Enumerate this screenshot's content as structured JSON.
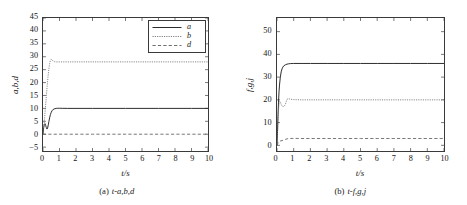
{
  "figure": {
    "panels": [
      {
        "id": "panel-a",
        "caption_number": "(a)",
        "caption_text": "t-a,b,d",
        "chart_data": {
          "type": "line",
          "title": "",
          "xlabel": "t/s",
          "ylabel": "a,b,d",
          "xlim": [
            0,
            10
          ],
          "ylim": [
            -6.5,
            45
          ],
          "xticks": [
            "0",
            "1",
            "2",
            "3",
            "4",
            "5",
            "6",
            "7",
            "8",
            "9",
            "10"
          ],
          "xtick_values": [
            0,
            1,
            2,
            3,
            4,
            5,
            6,
            7,
            8,
            9,
            10
          ],
          "yticks": [
            "-5",
            "0",
            "5",
            "10",
            "15",
            "20",
            "25",
            "30",
            "35",
            "40",
            "45"
          ],
          "ytick_values": [
            -5,
            0,
            5,
            10,
            15,
            20,
            25,
            30,
            35,
            40,
            45
          ],
          "grid": false,
          "legend_position": "upper right",
          "series": [
            {
              "name": "a",
              "style": "solid",
              "color": "#2b2b2b",
              "steady_value": 10,
              "x": [
                0,
                0.04,
                0.08,
                0.12,
                0.16,
                0.2,
                0.24,
                0.28,
                0.32,
                0.36,
                0.4,
                0.45,
                0.5,
                0.55,
                0.6,
                0.7,
                0.8,
                0.9,
                1.0,
                1.2,
                1.5,
                2.0,
                3.0,
                4.0,
                5.0,
                6.0,
                7.0,
                8.0,
                9.0,
                10.0
              ],
              "values": [
                0,
                2.6,
                3.8,
                4.1,
                3.5,
                2.6,
                2.0,
                2.4,
                3.6,
                5.0,
                6.3,
                7.6,
                8.5,
                9.1,
                9.5,
                9.85,
                10.0,
                10.05,
                10.05,
                10.02,
                10.0,
                10.0,
                10.0,
                10.0,
                10.0,
                10.0,
                10.0,
                10.0,
                10.0,
                10.0
              ]
            },
            {
              "name": "b",
              "style": "dotted",
              "color": "#6d6d6d",
              "steady_value": 28,
              "x": [
                0,
                0.05,
                0.1,
                0.15,
                0.2,
                0.25,
                0.3,
                0.35,
                0.4,
                0.45,
                0.5,
                0.55,
                0.6,
                0.7,
                0.8,
                1.0,
                1.5,
                2.0,
                3.0,
                4.0,
                5.0,
                6.0,
                7.0,
                8.0,
                9.0,
                10.0
              ],
              "values": [
                0,
                3.0,
                6.5,
                10.5,
                14.5,
                18.5,
                22.0,
                25.0,
                27.2,
                28.6,
                29.0,
                28.8,
                28.4,
                28.1,
                28.0,
                28.0,
                28.0,
                28.0,
                28.0,
                28.0,
                28.0,
                28.0,
                28.0,
                28.0,
                28.0,
                28.0
              ]
            },
            {
              "name": "d",
              "style": "dashed",
              "color": "#5c5c5c",
              "steady_value": 0,
              "x": [
                0,
                0.5,
                1,
                2,
                3,
                4,
                5,
                6,
                7,
                8,
                9,
                10
              ],
              "values": [
                0,
                0,
                0,
                0,
                0,
                0,
                0,
                0,
                0,
                0,
                0,
                0
              ]
            }
          ]
        }
      },
      {
        "id": "panel-b",
        "caption_number": "(b)",
        "caption_text": "t-f,g,j",
        "chart_data": {
          "type": "line",
          "title": "",
          "xlabel": "t/s",
          "ylabel": "f,g,j",
          "xlim": [
            0,
            10
          ],
          "ylim": [
            -2.5,
            56
          ],
          "xticks": [
            "0",
            "1",
            "2",
            "3",
            "4",
            "5",
            "6",
            "7",
            "8",
            "9",
            "10"
          ],
          "xtick_values": [
            0,
            1,
            2,
            3,
            4,
            5,
            6,
            7,
            8,
            9,
            10
          ],
          "yticks": [
            "0",
            "10",
            "20",
            "30",
            "40",
            "50"
          ],
          "ytick_values": [
            0,
            10,
            20,
            30,
            40,
            50
          ],
          "grid": false,
          "legend_position": "upper right",
          "series": [
            {
              "name": "f",
              "style": "solid",
              "color": "#2b2b2b",
              "steady_value": 36,
              "x": [
                0,
                0.03,
                0.06,
                0.09,
                0.12,
                0.15,
                0.2,
                0.25,
                0.3,
                0.35,
                0.4,
                0.5,
                0.6,
                0.7,
                0.8,
                1.0,
                1.5,
                2.0,
                3.0,
                4.0,
                5.0,
                6.0,
                7.0,
                8.0,
                9.0,
                10.0
              ],
              "values": [
                0,
                6,
                13,
                19,
                23.5,
                26.5,
                30.0,
                32.3,
                33.6,
                34.4,
                34.9,
                35.4,
                35.7,
                35.85,
                35.95,
                36.0,
                36.0,
                36.0,
                36.0,
                36.0,
                36.0,
                36.0,
                36.0,
                36.0,
                36.0,
                36.0
              ]
            },
            {
              "name": "g",
              "style": "dotted",
              "color": "#6d6d6d",
              "steady_value": 20,
              "x": [
                0,
                0.03,
                0.06,
                0.09,
                0.12,
                0.16,
                0.2,
                0.25,
                0.3,
                0.35,
                0.4,
                0.45,
                0.5,
                0.55,
                0.6,
                0.7,
                0.8,
                1.0,
                1.5,
                2.0,
                3.0,
                4.0,
                5.0,
                6.0,
                7.0,
                8.0,
                9.0,
                10.0
              ],
              "values": [
                0,
                5,
                11,
                15.5,
                18.0,
                19.3,
                19.0,
                18.0,
                17.3,
                17.0,
                17.1,
                17.4,
                18.0,
                19.2,
                20.3,
                20.5,
                20.3,
                20.1,
                20.0,
                20.0,
                20.0,
                20.0,
                20.0,
                20.0,
                20.0,
                20.0,
                20.0,
                20.0
              ]
            },
            {
              "name": "j",
              "style": "dashed",
              "color": "#5c5c5c",
              "steady_value": 3,
              "x": [
                0,
                0.05,
                0.1,
                0.2,
                0.3,
                0.4,
                0.5,
                0.6,
                0.8,
                1.0,
                1.5,
                2.0,
                3.0,
                4.0,
                5.0,
                6.0,
                7.0,
                8.0,
                9.0,
                10.0
              ],
              "values": [
                0,
                0.9,
                1.5,
                1.9,
                2.1,
                2.3,
                2.6,
                2.85,
                3.0,
                3.05,
                3.0,
                3.0,
                3.0,
                3.0,
                3.0,
                3.0,
                3.0,
                3.0,
                3.0,
                3.0
              ]
            }
          ]
        }
      }
    ]
  }
}
